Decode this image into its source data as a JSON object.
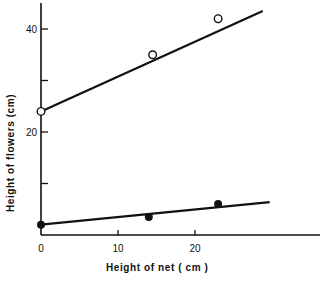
{
  "chart_data": {
    "type": "line",
    "title": "",
    "xlabel": "Height  of  net ( cm )",
    "ylabel": "Height  of  flowers  (cm)",
    "xlim": [
      0,
      36
    ],
    "ylim": [
      0,
      45
    ],
    "x_ticks": [
      0,
      10,
      20
    ],
    "x_tick_labels": [
      "0",
      "10",
      "20"
    ],
    "y_ticks": [
      10,
      20,
      30,
      40
    ],
    "y_tick_labels": [
      "",
      "20",
      "",
      "40"
    ],
    "grid": false,
    "legend": null,
    "series": [
      {
        "name": "open-circles",
        "marker": "open-circle",
        "points": [
          [
            0,
            24
          ],
          [
            14.5,
            35
          ],
          [
            23,
            42
          ]
        ],
        "fit_line": [
          [
            0,
            24
          ],
          [
            28.8,
            43.5
          ]
        ]
      },
      {
        "name": "filled-circles",
        "marker": "filled-circle",
        "points": [
          [
            0,
            2
          ],
          [
            14,
            3.5
          ],
          [
            23,
            6
          ]
        ],
        "fit_line": [
          [
            0,
            2
          ],
          [
            29.7,
            6.4
          ]
        ]
      }
    ]
  }
}
